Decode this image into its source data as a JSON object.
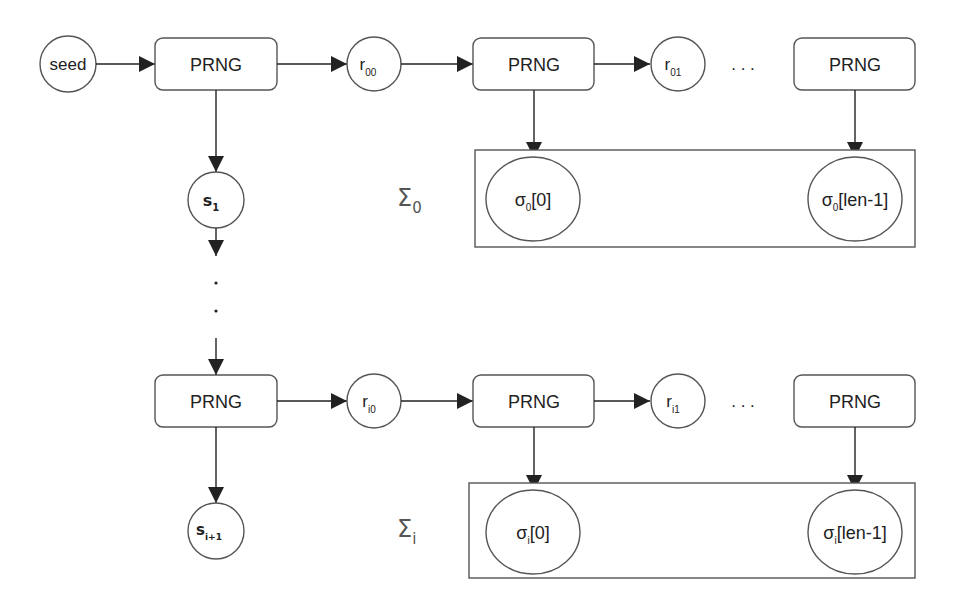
{
  "diagram": {
    "colors": {
      "stroke": "#555555",
      "arrow": "#222222",
      "text": "#222222",
      "sigma_label": "#555555"
    },
    "row0": {
      "seed": {
        "label": "seed"
      },
      "prng": [
        {
          "label": "PRNG"
        },
        {
          "label": "PRNG"
        },
        {
          "label": "PRNG"
        }
      ],
      "randoms": [
        {
          "base": "r",
          "sub": "00"
        },
        {
          "base": "r",
          "sub": "01"
        }
      ],
      "ellipsis": ". . .",
      "state": {
        "base": "s",
        "sub": "1"
      },
      "sigma_group": {
        "base": "Σ",
        "sub": "0"
      },
      "elements": [
        {
          "base": "σ",
          "sub": "0",
          "suffix": "[0]"
        },
        {
          "base": "σ",
          "sub": "0",
          "suffix": "[len-1]"
        }
      ]
    },
    "vertical_ellipsis": [
      "·",
      "·"
    ],
    "rowi": {
      "prng": [
        {
          "label": "PRNG"
        },
        {
          "label": "PRNG"
        },
        {
          "label": "PRNG"
        }
      ],
      "randoms": [
        {
          "base": "r",
          "sub": "i0"
        },
        {
          "base": "r",
          "sub": "i1"
        }
      ],
      "ellipsis": ". . .",
      "state": {
        "base": "s",
        "sub": "i+1"
      },
      "sigma_group": {
        "base": "Σ",
        "sub": "i"
      },
      "elements": [
        {
          "base": "σ",
          "sub": "i",
          "suffix": "[0]"
        },
        {
          "base": "σ",
          "sub": "i",
          "suffix": "[len-1]"
        }
      ]
    }
  }
}
